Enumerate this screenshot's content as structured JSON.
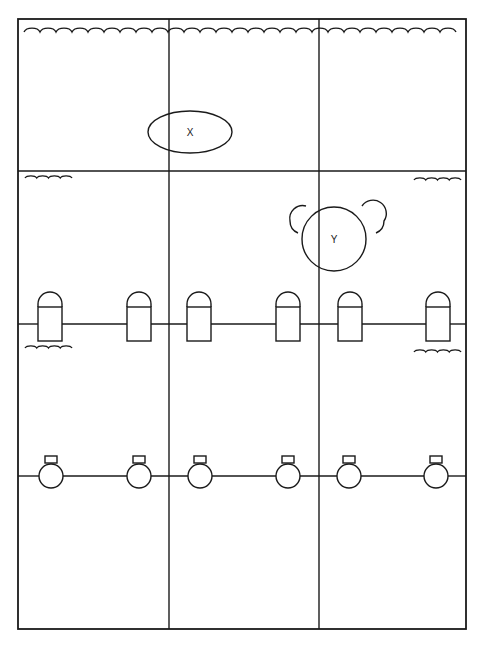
{
  "diagram": {
    "colors": {
      "stroke": "#1a1a1a",
      "background": "#ffffff"
    },
    "frame": {
      "x": 18,
      "y": 19,
      "width": 448,
      "height": 610
    },
    "grid": {
      "vertical_lines_x": [
        169,
        319
      ],
      "horizontal_line_y": 171
    },
    "top_wave": {
      "y": 32,
      "x_start": 24,
      "x_end": 463,
      "period": 16,
      "amplitude": 4
    },
    "small_waves": [
      {
        "name": "wave-upper-left",
        "x": 25,
        "y": 178,
        "width": 47
      },
      {
        "name": "wave-upper-right",
        "x": 414,
        "y": 180,
        "width": 47
      },
      {
        "name": "wave-lower-left",
        "x": 25,
        "y": 348,
        "width": 47
      },
      {
        "name": "wave-lower-right",
        "x": 414,
        "y": 352,
        "width": 47
      }
    ],
    "objects": {
      "x": {
        "label": "X",
        "cx": 190,
        "cy": 132,
        "rx": 42,
        "ry": 21
      },
      "y": {
        "label": "Y",
        "cx": 334,
        "cy": 239,
        "r": 32
      }
    },
    "bottle_row": {
      "line_y": 324,
      "bottles_x": [
        38,
        127,
        187,
        276,
        338,
        426
      ],
      "bottle_width": 24
    },
    "bulb_row": {
      "line_y": 476,
      "bulbs_cx": [
        51,
        139,
        200,
        288,
        349,
        436
      ],
      "radius": 12
    }
  }
}
